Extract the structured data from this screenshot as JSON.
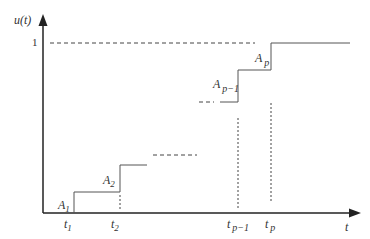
{
  "diagram": {
    "type": "step-function",
    "y_axis_label": "u(t)",
    "x_axis_label": "t",
    "y_tick_one": "1",
    "steps": [
      {
        "amplitude_label": "A",
        "amplitude_sub": "1",
        "time_label": "t",
        "time_sub": "1"
      },
      {
        "amplitude_label": "A",
        "amplitude_sub": "2",
        "time_label": "t",
        "time_sub": "2"
      },
      {
        "amplitude_label": "A",
        "amplitude_sub": "p−1",
        "time_label": "t",
        "time_sub": "p−1"
      },
      {
        "amplitude_label": "A",
        "amplitude_sub": "p",
        "time_label": "t",
        "time_sub": "p"
      }
    ],
    "colors": {
      "line": "#444444",
      "axis": "#222222"
    }
  }
}
